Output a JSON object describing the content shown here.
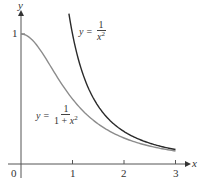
{
  "chart_data": {
    "type": "line",
    "title": "",
    "xlabel": "x",
    "ylabel": "y",
    "xlim": [
      0,
      3
    ],
    "ylim": [
      0,
      1.15
    ],
    "x_ticks": [
      "0",
      "1",
      "2",
      "3"
    ],
    "y_ticks": [
      "1"
    ],
    "grid": false,
    "series": [
      {
        "name": "y = 1/(1 + x^2)",
        "color": "#8c8c8c",
        "x": [
          0,
          0.25,
          0.5,
          0.75,
          1,
          1.25,
          1.5,
          1.75,
          2,
          2.25,
          2.5,
          2.75,
          3
        ],
        "y": [
          1,
          0.941,
          0.8,
          0.64,
          0.5,
          0.39,
          0.308,
          0.246,
          0.2,
          0.165,
          0.138,
          0.117,
          0.1
        ]
      },
      {
        "name": "y = 1/x^2",
        "color": "#2a2a2a",
        "x": [
          0.93,
          1,
          1.25,
          1.5,
          1.75,
          2,
          2.25,
          2.5,
          2.75,
          3
        ],
        "y": [
          1.156,
          1,
          0.64,
          0.444,
          0.327,
          0.25,
          0.198,
          0.16,
          0.132,
          0.111
        ]
      }
    ],
    "annotations": [
      {
        "text": "y = 1/x^2",
        "near_x": 1.5,
        "near_y": 1.05
      },
      {
        "text": "y = 1/(1 + x^2)",
        "near_x": 0.3,
        "near_y": 0.3
      }
    ]
  },
  "labels": {
    "origin": "0",
    "x_tick_1": "1",
    "x_tick_2": "2",
    "x_tick_3": "3",
    "y_tick_1": "1",
    "x_axis": "x",
    "y_axis": "y"
  },
  "equations": {
    "upper": {
      "lhs": "y",
      "eq": "=",
      "num": "1",
      "den_var": "x",
      "den_exp": "2"
    },
    "lower": {
      "lhs": "y",
      "eq": "=",
      "num": "1",
      "den_pre": "1 + ",
      "den_var": "x",
      "den_exp": "2"
    }
  }
}
